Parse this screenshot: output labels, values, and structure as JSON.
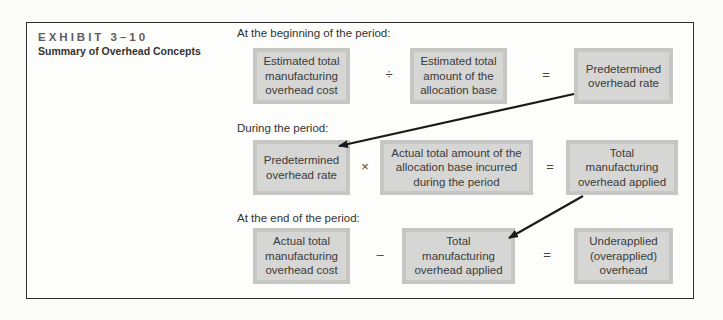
{
  "exhibit": {
    "number": "EXHIBIT 3–10",
    "title": "Summary of Overhead Concepts"
  },
  "rows": [
    {
      "label": "At the beginning of the period:",
      "boxes": [
        "Estimated total\nmanufacturing\noverhead cost",
        "Estimated total\namount of the\nallocation base",
        "Predetermined\noverhead rate"
      ],
      "operators": [
        "÷",
        "="
      ]
    },
    {
      "label": "During the period:",
      "boxes": [
        "Predetermined\noverhead rate",
        "Actual total amount of the\nallocation base incurred\nduring the period",
        "Total\nmanufacturing\noverhead applied"
      ],
      "operators": [
        "×",
        "="
      ]
    },
    {
      "label": "At the end of the period:",
      "boxes": [
        "Actual total\nmanufacturing\noverhead cost",
        "Total\nmanufacturing\noverhead applied",
        "Underapplied\n(overapplied)\noverhead"
      ],
      "operators": [
        "–",
        "="
      ]
    }
  ],
  "colors": {
    "box_fill": "#d6d6d4",
    "box_border": "#c6c6c3",
    "frame": "#2e2e2e",
    "arrow": "#1a1a1a"
  }
}
